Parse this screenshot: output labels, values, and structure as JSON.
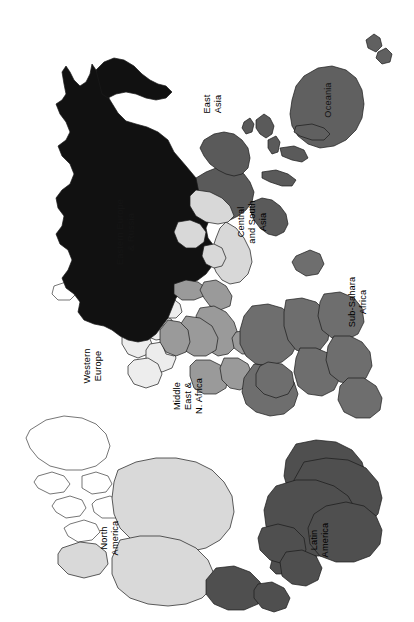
{
  "figure": {
    "type": "world-region-choropleth-map",
    "orientation": "rotated 90 degrees counter-clockwise",
    "background_color": "#ffffff",
    "outline_color": "#1a1a1a",
    "width": 414,
    "height": 622
  },
  "regions": [
    {
      "id": "eastern-europe-russia",
      "label_lines": [
        "Eastern Europe",
        "& Russia"
      ],
      "label_full": "Eastern Europe & Russia",
      "fill": "#111111",
      "shade": "black",
      "label_x": 126,
      "label_y": 232,
      "label_on_dark": true
    },
    {
      "id": "east-asia",
      "label_lines": [
        "East",
        "Asia"
      ],
      "label_full": "East Asia",
      "fill": "#5a5a5a",
      "shade": "dark-gray",
      "label_x": 213,
      "label_y": 104,
      "label_on_dark": false
    },
    {
      "id": "oceania",
      "label_lines": [
        "Oceania"
      ],
      "label_full": "Oceania",
      "fill": "#606060",
      "shade": "dark-gray",
      "label_x": 329,
      "label_y": 100,
      "label_on_dark": true
    },
    {
      "id": "central-south-asia",
      "label_lines": [
        "Central",
        "and South",
        "Asia"
      ],
      "label_full": "Central and South Asia",
      "fill": "#d8d8d8",
      "shade": "light-gray",
      "label_x": 253,
      "label_y": 222,
      "label_on_dark": false
    },
    {
      "id": "sub-sahara-africa",
      "label_lines": [
        "Sub-Sahara",
        "Africa"
      ],
      "label_full": "Sub-Sahara Africa",
      "fill": "#6e6e6e",
      "shade": "medium-dark-gray",
      "label_x": 358,
      "label_y": 302,
      "label_on_dark": false
    },
    {
      "id": "middle-east-north-africa",
      "label_lines": [
        "Middle",
        "East &",
        "N. Africa"
      ],
      "label_full": "Middle East & N. Africa",
      "fill": "#9a9a9a",
      "shade": "medium-gray",
      "label_x": 189,
      "label_y": 396,
      "label_on_dark": false
    },
    {
      "id": "western-europe",
      "label_lines": [
        "Western",
        "Europe"
      ],
      "label_full": "Western Europe",
      "fill": "#ededed",
      "shade": "near-white",
      "label_x": 93,
      "label_y": 366,
      "label_on_dark": false
    },
    {
      "id": "north-america",
      "label_lines": [
        "North",
        "America"
      ],
      "label_full": "North America",
      "fill": "#d9d9d9",
      "shade": "light-gray",
      "label_x": 110,
      "label_y": 538,
      "label_on_dark": false
    },
    {
      "id": "latin-america",
      "label_lines": [
        "Latin",
        "America"
      ],
      "label_full": "Latin America",
      "fill": "#4f4f4f",
      "shade": "dark-gray",
      "label_x": 320,
      "label_y": 540,
      "label_on_dark": false
    },
    {
      "id": "unclassified",
      "label_lines": [],
      "label_full": "",
      "fill": "#ffffff",
      "shade": "white",
      "label_x": 0,
      "label_y": 0,
      "label_on_dark": false
    }
  ],
  "shapes": {
    "russia": "M196,178 L186,166 L174,152 L168,140 L158,132 L147,127 L136,124 L126,121 L118,113 L110,100 L104,88 L100,78 L96,70 L92,64 L90,74 L86,82 L80,86 L74,80 L70,72 L66,66 L62,72 L64,84 L66,94 L62,100 L56,104 L60,114 L66,122 L70,132 L66,140 L58,146 L62,156 L70,164 L74,174 L70,184 L62,190 L56,198 L58,208 L64,216 L62,226 L56,234 L60,244 L68,250 L72,260 L68,270 L62,278 L66,288 L74,294 L80,302 L78,312 L84,320 L94,324 L104,326 L112,330 L120,336 L128,340 L138,342 L148,340 L156,334 L162,326 L168,318 L172,308 L176,298 L182,290 L190,284 L198,280 L206,274 L212,266 L216,256 L214,246 L208,238 L206,228 L210,218 L214,208 L212,198 L206,190 Z",
    "scandinavia": "M96,70 L104,62 L114,58 L124,60 L134,66 L142,74 L150,80 L158,84 L166,86 L172,92 L166,98 L156,100 L146,98 L136,94 L126,92 L116,94 L108,98 L102,94 Z",
    "china": "M196,178 L206,172 L216,168 L226,166 L236,168 L244,174 L250,182 L254,192 L252,202 L246,210 L238,216 L230,220 L222,222 L214,220 L208,214 L204,206 L200,198 L198,188 Z",
    "china2": "M204,140 L214,134 L224,132 L234,134 L242,140 L248,148 L250,158 L248,168 L242,174 L234,176 L226,174 L218,170 L210,164 L204,156 L200,148 Z",
    "japan": "M256,120 L264,114 L270,118 L274,126 L272,134 L266,138 L260,134 L256,128 Z",
    "korea": "M244,122 L250,118 L254,124 L252,132 L246,134 L242,128 Z",
    "seasia": "M252,202 L262,198 L272,200 L280,206 L286,214 L288,224 L284,232 L276,236 L268,234 L260,228 L254,220 L250,210 Z",
    "indonesia1": "M262,172 L276,170 L288,174 L296,180 L292,186 L282,186 L270,182 L262,178 Z",
    "indonesia2": "M280,148 L294,146 L304,150 L308,158 L302,162 L292,160 L282,156 Z",
    "philippines": "M268,140 L276,136 L280,142 L278,152 L272,154 L268,148 Z",
    "newguinea": "M296,126 L312,124 L324,128 L330,134 L324,140 L312,140 L300,136 L294,132 Z",
    "australia": "M304,76 L318,68 L332,66 L346,70 L356,78 L362,90 L364,104 L362,118 L356,130 L346,140 L334,146 L320,148 L308,144 L298,136 L292,126 L290,114 L292,100 L296,86 Z",
    "nz1": "M366,40 L374,34 L380,38 L382,46 L376,52 L368,48 Z",
    "nz2": "M378,52 L386,48 L392,54 L390,62 L382,64 L376,58 Z",
    "india": "M226,222 L236,228 L244,238 L250,250 L252,262 L248,274 L240,282 L230,284 L222,280 L216,272 L212,262 L212,250 L216,238 L220,228 Z",
    "centralasia": "M196,190 L210,192 L222,198 L230,206 L234,216 L228,222 L218,224 L206,222 L196,216 L190,206 L190,196 Z",
    "stan2": "M178,222 L190,220 L200,224 L206,232 L204,242 L196,248 L186,248 L178,242 L174,232 Z",
    "pakistan": "M204,246 L214,244 L222,248 L226,258 L222,266 L214,268 L206,264 L202,256 Z",
    "turkey": "M174,284 L186,280 L198,282 L206,288 L204,296 L194,300 L182,300 L174,294 Z",
    "arabia": "M200,308 L214,306 L226,312 L234,322 L238,334 L236,346 L228,354 L218,356 L208,350 L202,340 L198,328 L196,316 Z",
    "iran": "M204,282 L216,280 L226,286 L232,296 L230,306 L220,310 L210,306 L204,298 L200,290 Z",
    "northafrica1": "M186,316 L200,318 L212,326 L218,338 L216,350 L206,356 L194,356 L184,350 L178,340 L178,328 Z",
    "northafrica2": "M168,320 L180,322 L188,330 L190,342 L186,352 L176,356 L166,352 L160,342 L160,330 Z",
    "northafrica3": "M196,360 L210,360 L222,366 L228,376 L226,388 L216,394 L204,394 L194,388 L190,376 L190,366 Z",
    "northafrica4": "M224,358 L238,358 L248,364 L252,374 L250,384 L240,390 L230,388 L222,380 L220,368 Z",
    "egypt": "M236,332 L248,330 L256,336 L258,346 L252,354 L242,354 L234,348 L232,338 Z",
    "africa1": "M252,306 L268,304 L282,308 L292,316 L298,328 L298,342 L292,354 L282,362 L268,366 L256,364 L246,356 L240,344 L240,330 L244,316 Z",
    "africa2": "M254,364 L270,366 L284,372 L294,382 L298,394 L294,406 L284,414 L270,416 L256,412 L246,404 L242,392 L244,378 Z",
    "africa3": "M286,300 L302,298 L316,302 L326,312 L330,326 L328,340 L320,350 L308,354 L296,350 L288,340 L284,326 L284,312 Z",
    "africa4": "M300,348 L316,348 L330,354 L338,364 L340,378 L334,390 L322,396 L308,394 L298,386 L294,372 L296,358 Z",
    "africa5": "M324,294 L340,292 L354,298 L362,308 L364,322 L358,334 L346,340 L332,338 L322,330 L318,316 L320,302 Z",
    "africa6": "M334,336 L350,336 L362,342 L370,352 L372,366 L366,378 L354,384 L340,382 L330,374 L326,360 L328,346 Z",
    "southafrica": "M348,378 L364,378 L376,386 L382,398 L380,410 L370,418 L356,418 L344,412 L338,400 L340,386 Z",
    "madagascar": "M296,256 L310,250 L320,254 L324,264 L318,274 L306,276 L296,270 L292,262 Z",
    "wafrica1": "M268,362 L282,364 L292,372 L294,384 L288,394 L276,398 L264,394 L256,386 L256,374 L260,366 Z",
    "weurope1": "M140,316 L152,312 L164,314 L172,320 L174,330 L168,338 L156,340 L146,336 L138,328 Z",
    "weurope2": "M126,330 L138,328 L148,334 L152,344 L148,354 L138,358 L128,354 L122,344 L122,336 Z",
    "weurope3": "M150,344 L162,342 L172,348 L176,358 L172,368 L162,372 L152,368 L146,358 L146,350 Z",
    "weurope4": "M160,300 L172,298 L180,304 L182,312 L176,318 L166,318 L158,312 L156,304 Z",
    "iberia": "M134,360 L148,358 L158,364 L162,374 L158,384 L146,388 L134,384 L128,374 L128,366 Z",
    "italy": "M164,330 L174,328 L180,336 L180,348 L174,356 L166,354 L162,344 Z",
    "britain1": "M116,298 L126,294 L132,300 L132,310 L126,316 L118,312 L114,304 Z",
    "britain2": "M104,300 L112,296 L116,302 L114,310 L106,312 L102,306 Z",
    "iceland": "M54,286 L66,282 L74,286 L76,294 L70,300 L58,300 L52,294 Z",
    "greenland": "M30,430 L46,420 L64,416 L82,418 L96,424 L106,434 L110,446 L106,458 L96,466 L82,470 L66,470 L50,466 L38,458 L30,448 L26,438 Z",
    "arcticisl1": "M38,476 L52,472 L64,476 L70,484 L64,492 L50,494 L38,488 L34,482 Z",
    "arcticisl2": "M56,500 L70,496 L82,500 L86,508 L80,516 L66,518 L56,512 L52,506 Z",
    "arcticisl3": "M82,476 L96,472 L108,476 L112,484 L106,492 L92,494 L82,488 Z",
    "arcticisl4": "M96,500 L110,496 L122,502 L124,512 L116,518 L102,518 L94,512 L92,504 Z",
    "arcticisl5": "M70,524 L84,520 L96,524 L100,532 L92,540 L78,542 L68,536 L64,528 Z",
    "canada": "M118,470 L136,462 L156,458 L176,458 L196,462 L212,470 L224,482 L232,496 L234,512 L230,528 L220,540 L206,548 L188,552 L168,552 L148,548 L132,540 L120,528 L114,514 L112,498 L114,482 Z",
    "usa": "M120,540 L140,536 L160,536 L180,540 L196,548 L208,560 L214,574 L212,588 L202,598 L186,604 L168,606 L148,604 L130,598 L118,588 L112,574 L112,558 Z",
    "alaska": "M62,548 L80,542 L96,544 L106,552 L108,564 L100,574 L84,578 L68,574 L58,564 L58,554 Z",
    "mexico": "M216,568 L234,566 L250,572 L260,582 L264,594 L258,604 L244,610 L228,610 L214,604 L206,594 L206,580 Z",
    "centralamerica": "M258,584 L272,582 L284,588 L290,598 L286,608 L274,612 L262,608 L254,598 L254,590 Z",
    "caribbean1": "M272,560 L284,556 L294,560 L296,568 L288,574 L276,574 L270,568 Z",
    "caribbean2": "M298,556 L308,552 L316,556 L318,564 L310,570 L300,568 L296,562 Z",
    "samerica1": "M276,486 L296,480 L316,480 L334,486 L348,496 L356,510 L358,526 L352,540 L340,550 L324,556 L306,556 L288,550 L274,540 L266,526 L264,510 L268,496 Z",
    "samerica2": "M296,444 L316,440 L336,442 L352,450 L362,462 L366,476 L362,490 L350,500 L334,506 L316,506 L300,500 L288,490 L284,476 L286,460 Z",
    "samerica3": "M326,506 L346,502 L364,506 L376,516 L382,530 L380,544 L370,556 L354,562 L336,562 L320,556 L310,544 L308,528 L314,514 Z",
    "samerica4": "M262,528 L278,524 L294,528 L304,538 L306,550 L298,560 L284,564 L270,560 L260,550 L258,538 Z",
    "samerica5": "M286,552 L302,550 L316,556 L322,568 L318,580 L306,586 L292,584 L282,576 L280,562 Z",
    "brazil": "M304,462 L326,458 L348,460 L366,468 L378,482 L382,498 L378,514 L366,526 L348,532 L328,532 L310,526 L298,514 L292,498 L294,480 Z"
  }
}
